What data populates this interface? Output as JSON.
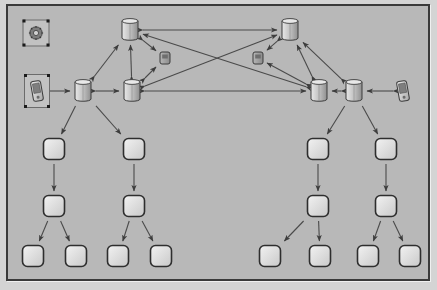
{
  "diagram": {
    "canvas_bg": "#b8b8b8",
    "border_color": "#3a3a3a",
    "line_color": "#4a4a4a"
  },
  "palette": {
    "server_light": "#e8e8e8",
    "server_mid": "#bdbdbd",
    "server_dark": "#8f8f8f",
    "box_light": "#f2f2f2",
    "box_mid": "#c9c9c9",
    "box_edge": "#2e2e2e",
    "text": "#111111"
  },
  "nodes": [
    {
      "id": "global",
      "label": "global",
      "top_label": "i_ngn",
      "type": "gear-icon",
      "x": 28,
      "y": 27,
      "selected": true
    },
    {
      "id": "icscf1",
      "label": "icscf1",
      "type": "server",
      "x": 122,
      "y": 24
    },
    {
      "id": "icscf2",
      "label": "icscf2",
      "type": "server",
      "x": 282,
      "y": 24
    },
    {
      "id": "suafe1",
      "label": "suafe1_saafe1",
      "type": "small-box",
      "x": 157,
      "y": 52
    },
    {
      "id": "suafe2",
      "label": "suafe2_saafe2",
      "type": "small-box",
      "x": 250,
      "y": 52
    },
    {
      "id": "ue1",
      "label": "ue1",
      "type": "phone-icon",
      "x": 29,
      "y": 85,
      "selected": true
    },
    {
      "id": "pcscf1",
      "label": "pcscf1",
      "type": "server",
      "x": 75,
      "y": 85
    },
    {
      "id": "scscf1",
      "label": "scscf1",
      "type": "server",
      "x": 124,
      "y": 85
    },
    {
      "id": "scscf2",
      "label": "scscf2",
      "type": "server",
      "x": 311,
      "y": 85
    },
    {
      "id": "pcscf2",
      "label": "pcscf2",
      "type": "server",
      "x": 346,
      "y": 85
    },
    {
      "id": "ue2",
      "label": "ue2",
      "type": "phone-icon",
      "x": 395,
      "y": 85
    },
    {
      "id": "gateapp_a1",
      "label": "gateapp_a1",
      "type": "rounded-box",
      "x": 46,
      "y": 143
    },
    {
      "id": "gateapp_c1",
      "label": "gateapp_c1",
      "type": "rounded-box",
      "x": 126,
      "y": 143
    },
    {
      "id": "gateapp_c2",
      "label": "gateapp_c2",
      "type": "rounded-box",
      "x": 310,
      "y": 143
    },
    {
      "id": "gateapp_a2",
      "label": "gateapp_a2",
      "type": "rounded-box",
      "x": 378,
      "y": 143
    },
    {
      "id": "controller_a1",
      "label": "controller_a1",
      "type": "rounded-box",
      "x": 46,
      "y": 200
    },
    {
      "id": "controller_c1",
      "label": "controller_c1",
      "type": "rounded-box",
      "x": 126,
      "y": 200
    },
    {
      "id": "controller_c2",
      "label": "controller_c2",
      "type": "rounded-box",
      "x": 310,
      "y": 200
    },
    {
      "id": "controller_a2",
      "label": "controller_a2",
      "type": "rounded-box",
      "x": 378,
      "y": 200
    },
    {
      "id": "switch_a1a",
      "label": "switch_a1a",
      "type": "rounded-box",
      "x": 25,
      "y": 250
    },
    {
      "id": "switch_a1b",
      "label": "switch_a1b",
      "type": "rounded-box",
      "x": 68,
      "y": 250
    },
    {
      "id": "switch_c1a",
      "label": "switch_c1a",
      "type": "rounded-box",
      "x": 110,
      "y": 250
    },
    {
      "id": "switch_c1b",
      "label": "switch_c1b",
      "type": "rounded-box",
      "x": 153,
      "y": 250
    },
    {
      "id": "switch_c2a",
      "label": "switch_c2a",
      "type": "rounded-box",
      "x": 262,
      "y": 250
    },
    {
      "id": "switch_c2b",
      "label": "switch_c2b",
      "type": "rounded-box",
      "x": 312,
      "y": 250
    },
    {
      "id": "switch_a2a",
      "label": "switch_a2a",
      "type": "rounded-box",
      "x": 360,
      "y": 250
    },
    {
      "id": "switch_a2b",
      "label": "switch_a2b",
      "type": "rounded-box",
      "x": 402,
      "y": 250
    }
  ],
  "edges": [
    {
      "from": "ue1",
      "to": "pcscf1",
      "arrows": "both"
    },
    {
      "from": "pcscf1",
      "to": "scscf1",
      "arrows": "both"
    },
    {
      "from": "pcscf1",
      "to": "icscf1",
      "arrows": "both"
    },
    {
      "from": "scscf1",
      "to": "icscf1",
      "arrows": "both"
    },
    {
      "from": "scscf1",
      "to": "suafe1",
      "arrows": "both"
    },
    {
      "from": "icscf1",
      "to": "suafe1",
      "arrows": "both"
    },
    {
      "from": "ue2",
      "to": "pcscf2",
      "arrows": "both"
    },
    {
      "from": "pcscf2",
      "to": "scscf2",
      "arrows": "both"
    },
    {
      "from": "pcscf2",
      "to": "icscf2",
      "arrows": "both"
    },
    {
      "from": "scscf2",
      "to": "icscf2",
      "arrows": "both"
    },
    {
      "from": "scscf2",
      "to": "suafe2",
      "arrows": "both"
    },
    {
      "from": "icscf2",
      "to": "suafe2",
      "arrows": "both"
    },
    {
      "from": "scscf1",
      "to": "scscf2",
      "arrows": "both"
    },
    {
      "from": "scscf1",
      "to": "icscf2",
      "arrows": "both"
    },
    {
      "from": "scscf2",
      "to": "icscf1",
      "arrows": "both"
    },
    {
      "from": "icscf1",
      "to": "icscf2",
      "arrows": "both"
    },
    {
      "from": "pcscf1",
      "to": "gateapp_a1",
      "arrows": "to"
    },
    {
      "from": "pcscf1",
      "to": "gateapp_c1",
      "arrows": "to"
    },
    {
      "from": "pcscf2",
      "to": "gateapp_c2",
      "arrows": "to"
    },
    {
      "from": "pcscf2",
      "to": "gateapp_a2",
      "arrows": "to"
    },
    {
      "from": "gateapp_a1",
      "to": "controller_a1",
      "arrows": "to"
    },
    {
      "from": "gateapp_c1",
      "to": "controller_c1",
      "arrows": "to"
    },
    {
      "from": "gateapp_c2",
      "to": "controller_c2",
      "arrows": "to"
    },
    {
      "from": "gateapp_a2",
      "to": "controller_a2",
      "arrows": "to"
    },
    {
      "from": "controller_a1",
      "to": "switch_a1a",
      "arrows": "to"
    },
    {
      "from": "controller_a1",
      "to": "switch_a1b",
      "arrows": "to"
    },
    {
      "from": "controller_c1",
      "to": "switch_c1a",
      "arrows": "to"
    },
    {
      "from": "controller_c1",
      "to": "switch_c1b",
      "arrows": "to"
    },
    {
      "from": "controller_c2",
      "to": "switch_c2a",
      "arrows": "to"
    },
    {
      "from": "controller_c2",
      "to": "switch_c2b",
      "arrows": "to"
    },
    {
      "from": "controller_a2",
      "to": "switch_a2a",
      "arrows": "to"
    },
    {
      "from": "controller_a2",
      "to": "switch_a2b",
      "arrows": "to"
    }
  ]
}
